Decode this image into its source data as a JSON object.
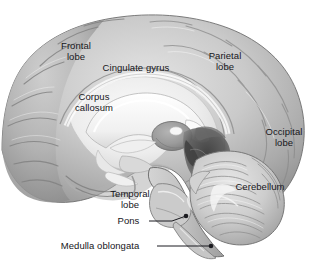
{
  "figure": {
    "type": "anatomical-illustration",
    "style": "grayscale medical illustration",
    "width": 316,
    "height": 269,
    "background_color": "#ffffff"
  },
  "colors": {
    "background": "#ffffff",
    "label_text": "#16161a",
    "leader_line": "#1b1b20",
    "cortex_light": "#d8d8d8",
    "cortex_mid": "#b9b9b9",
    "cortex_dark": "#969696",
    "sulcus_shadow": "#7e7e7e",
    "white_matter": "#f2f2f2",
    "corpus_callosum": "#fbfbfb",
    "brainstem": "#c0c0c0",
    "midbrain_dark": "#4a4a4a",
    "cerebellum": "#cfcfcf",
    "cerebellum_folia": "#8d8d8d",
    "outline": "#5a5a5a"
  },
  "labels": [
    {
      "id": "frontal-lobe",
      "name": "Frontal lobe",
      "lines": [
        "Frontal",
        "lobe"
      ],
      "x": 51,
      "y": 41,
      "width": 50,
      "placement": "on-structure",
      "leader": false
    },
    {
      "id": "cingulate-gyrus",
      "name": "Cingulate gyrus",
      "lines": [
        "Cingulate gyrus"
      ],
      "x": 93,
      "y": 63,
      "width": 86,
      "placement": "on-structure",
      "leader": false
    },
    {
      "id": "parietal-lobe",
      "name": "Parietal lobe",
      "lines": [
        "Parietal",
        "lobe"
      ],
      "x": 200,
      "y": 51,
      "width": 50,
      "placement": "on-structure",
      "leader": false
    },
    {
      "id": "corpus-callosum",
      "name": "Corpus callosum",
      "lines": [
        "Corpus",
        "callosum"
      ],
      "x": 65,
      "y": 92,
      "width": 58,
      "placement": "on-structure",
      "leader": false
    },
    {
      "id": "occipital-lobe",
      "name": "Occipital lobe",
      "lines": [
        "Occipital",
        "lobe"
      ],
      "x": 258,
      "y": 127,
      "width": 52,
      "placement": "on-structure",
      "leader": false
    },
    {
      "id": "temporal-lobe",
      "name": "Temporal lobe",
      "lines": [
        "Temporal",
        "lobe"
      ],
      "x": 103,
      "y": 189,
      "width": 54,
      "placement": "on-structure",
      "leader": false
    },
    {
      "id": "cerebellum",
      "name": "Cerebellum",
      "lines": [
        "Cerebellum"
      ],
      "x": 229,
      "y": 182,
      "width": 62,
      "placement": "on-structure",
      "leader": false
    },
    {
      "id": "pons",
      "name": "Pons",
      "lines": [
        "Pons"
      ],
      "x": 115,
      "y": 216,
      "width": 27,
      "placement": "outside-left",
      "leader": true
    },
    {
      "id": "medulla-oblongata",
      "name": "Medulla oblongata",
      "lines": [
        "Medulla oblongata"
      ],
      "x": 48,
      "y": 241,
      "width": 104,
      "placement": "outside-left",
      "leader": true
    }
  ],
  "leader_lines": [
    {
      "id": "pons-leader",
      "label": "Pons",
      "from_x": 149,
      "from_y": 221,
      "to_x": 186,
      "to_y": 216,
      "bend_x": 172,
      "bend_y": 221,
      "endpoint_dot": true,
      "dot_radius": 2.3
    },
    {
      "id": "medulla-leader",
      "label": "Medulla oblongata",
      "from_x": 157,
      "from_y": 246,
      "to_x": 211,
      "to_y": 246,
      "bend_x": 211,
      "bend_y": 246,
      "endpoint_dot": true,
      "dot_radius": 2.3
    }
  ],
  "structures_depicted": [
    "cerebral cortex (frontal, parietal, occipital, temporal lobes)",
    "cingulate gyrus",
    "corpus callosum",
    "thalamus",
    "midbrain",
    "pons",
    "medulla oblongata",
    "cerebellum"
  ]
}
